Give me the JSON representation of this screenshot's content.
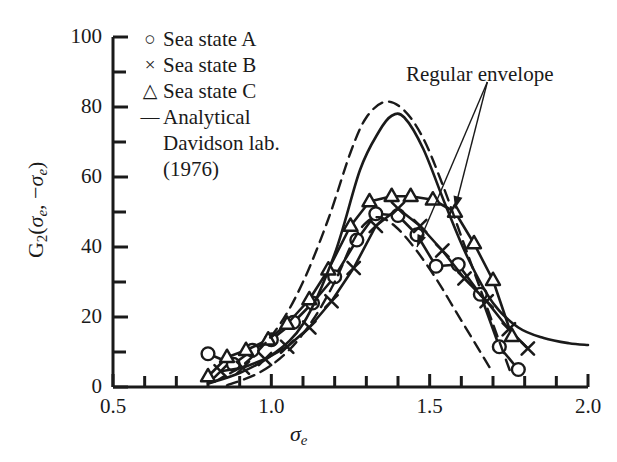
{
  "chart_data": {
    "type": "line",
    "title": "",
    "xlabel": "sigma_e",
    "ylabel": "G2(sigma_e, -sigma_e)",
    "xlim": [
      0.5,
      2.0
    ],
    "ylim": [
      0,
      100
    ],
    "x_ticks_major": [
      "0.5",
      "1.0",
      "1.5",
      "2.0"
    ],
    "x_tick_values_major": [
      0.5,
      1.0,
      1.5,
      2.0
    ],
    "x_tick_values_minor": [
      0.6,
      0.7,
      0.8,
      0.9,
      1.1,
      1.2,
      1.3,
      1.4,
      1.6,
      1.7,
      1.8,
      1.9
    ],
    "y_ticks_major": [
      "0",
      "20",
      "40",
      "60",
      "80",
      "100"
    ],
    "y_tick_values_major": [
      0,
      20,
      40,
      60,
      80,
      100
    ],
    "y_tick_values_minor": [
      10,
      30,
      50,
      70,
      90
    ],
    "grid": false,
    "legend_position": "top-left-inside",
    "annotations": [
      {
        "text": "Regular envelope",
        "x": 1.72,
        "y": 90,
        "arrow_targets": [
          [
            1.58,
            51
          ],
          [
            1.46,
            40
          ]
        ]
      }
    ],
    "series": [
      {
        "name": "Sea state A",
        "marker": "circle",
        "linestyle": "solid",
        "x": [
          0.8,
          0.88,
          0.94,
          1.0,
          1.07,
          1.13,
          1.2,
          1.27,
          1.33,
          1.4,
          1.46,
          1.52,
          1.59,
          1.66,
          1.72,
          1.78
        ],
        "y": [
          9.5,
          6.5,
          10.5,
          13.5,
          18.5,
          24.0,
          31.5,
          42.0,
          49.5,
          49.0,
          43.5,
          34.5,
          35.0,
          26.5,
          11.5,
          5.0
        ]
      },
      {
        "name": "Sea state B",
        "marker": "cross",
        "linestyle": "solid",
        "x": [
          0.84,
          0.91,
          0.98,
          1.05,
          1.12,
          1.19,
          1.26,
          1.33,
          1.4,
          1.47,
          1.54,
          1.61,
          1.68,
          1.75,
          1.81
        ],
        "y": [
          4.5,
          5.5,
          8.0,
          11.5,
          17.0,
          24.5,
          34.0,
          46.0,
          51.0,
          46.0,
          39.0,
          31.0,
          24.5,
          16.5,
          11.0
        ]
      },
      {
        "name": "Sea state C",
        "marker": "triangle",
        "linestyle": "solid",
        "x": [
          0.8,
          0.86,
          0.92,
          0.99,
          1.05,
          1.12,
          1.18,
          1.25,
          1.31,
          1.38,
          1.44,
          1.51,
          1.58,
          1.64,
          1.7,
          1.76
        ],
        "y": [
          3.0,
          8.5,
          10.5,
          13.5,
          18.0,
          25.0,
          33.5,
          46.0,
          53.0,
          54.5,
          54.5,
          53.5,
          50.0,
          41.0,
          30.5,
          14.5
        ]
      },
      {
        "name": "Analytical Davidson lab. (1976)",
        "marker": "none",
        "linestyle": "solid",
        "x": [
          0.8,
          0.9,
          1.0,
          1.1,
          1.2,
          1.28,
          1.34,
          1.38,
          1.42,
          1.48,
          1.55,
          1.62,
          1.7,
          1.78,
          1.86,
          1.94,
          2.0
        ],
        "y": [
          1.0,
          4.0,
          9.0,
          18.0,
          38.0,
          62.0,
          73.0,
          77.5,
          77.0,
          68.0,
          52.0,
          37.0,
          24.0,
          17.0,
          14.0,
          12.5,
          12.0
        ]
      },
      {
        "name": "Regular envelope",
        "marker": "none",
        "linestyle": "dashed",
        "x": [
          0.82,
          0.92,
          1.02,
          1.1,
          1.18,
          1.25,
          1.3,
          1.36,
          1.42,
          1.48,
          1.54,
          1.6,
          1.66,
          1.72,
          1.76
        ],
        "y": [
          1.5,
          7.0,
          17.0,
          30.0,
          48.0,
          67.0,
          77.0,
          81.5,
          79.0,
          71.0,
          58.0,
          43.0,
          28.0,
          13.0,
          3.0
        ]
      },
      {
        "name": "Regular envelope inner",
        "marker": "none",
        "linestyle": "dashed",
        "x": [
          0.86,
          0.96,
          1.05,
          1.13,
          1.2,
          1.26,
          1.3,
          1.34,
          1.39,
          1.45,
          1.52,
          1.58,
          1.64,
          1.7
        ],
        "y": [
          0.5,
          4.0,
          10.0,
          19.0,
          30.0,
          42.0,
          47.0,
          48.5,
          46.0,
          40.0,
          31.0,
          22.0,
          13.0,
          4.0
        ]
      }
    ]
  },
  "axes": {
    "y_title_prefix": "G",
    "y_title_sub": "2",
    "y_title_rest_open": "(",
    "y_title_sigma1": "σ",
    "y_title_sigma1_sub": "e",
    "y_title_comma": ", −",
    "y_title_sigma2": "σ",
    "y_title_sigma2_sub": "e",
    "y_title_close": ")",
    "x_title_sigma": "σ",
    "x_title_sub": "e"
  },
  "legend": {
    "rows": [
      {
        "symbol": "○",
        "symbol_name": "circle-marker",
        "label": "Sea state A"
      },
      {
        "symbol": "×",
        "symbol_name": "cross-marker",
        "label": "Sea state B"
      },
      {
        "symbol": "△",
        "symbol_name": "triangle-marker",
        "label": "Sea state C"
      },
      {
        "symbol": "—",
        "symbol_name": "line-marker",
        "label": "Analytical"
      }
    ],
    "continuation_1": "Davidson lab.",
    "continuation_2": "(1976)"
  },
  "annotation": {
    "regular_envelope_label": "Regular envelope"
  },
  "colors": {
    "ink": "#1a1a1a",
    "background": "#ffffff"
  }
}
